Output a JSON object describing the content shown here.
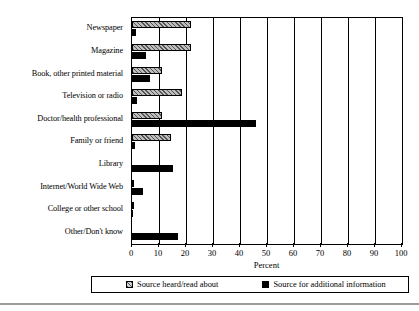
{
  "chart_data": {
    "type": "bar",
    "orientation": "horizontal",
    "title": "",
    "xlabel": "Percent",
    "ylabel": "",
    "xlim": [
      0,
      100
    ],
    "xticks": [
      0,
      10,
      20,
      30,
      40,
      50,
      60,
      70,
      80,
      90,
      100
    ],
    "grid": "vertical",
    "legend_position": "bottom",
    "categories": [
      "Newspaper",
      "Magazine",
      "Book, other printed material",
      "Television or radio",
      "Doctor/health professional",
      "Family or friend",
      "Library",
      "Internet/World Wide Web",
      "College or other school",
      "Other/Don't know"
    ],
    "series": [
      {
        "name": "Source heard/read about",
        "pattern": "hatched",
        "color": "#bdbdbd",
        "values": [
          22,
          22,
          11,
          18.5,
          11,
          14.5,
          0,
          0.3,
          0.3,
          0
        ]
      },
      {
        "name": "Source for additional information",
        "pattern": "solid",
        "color": "#000000",
        "values": [
          1.5,
          5,
          6.5,
          2,
          46,
          1.2,
          15,
          4,
          0.3,
          17
        ]
      }
    ]
  },
  "legend": {
    "entries": [
      {
        "label": "Source heard/read about"
      },
      {
        "label": "Source for additional information"
      }
    ]
  },
  "axis": {
    "x_title": "Percent"
  }
}
